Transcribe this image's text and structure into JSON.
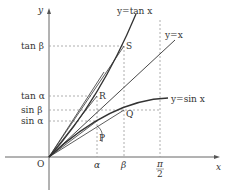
{
  "diagram": {
    "axes": {
      "x_label": "x",
      "y_label": "y",
      "origin_label": "O"
    },
    "curves": [
      {
        "id": "tan",
        "label": "y=tan x"
      },
      {
        "id": "identity",
        "label": "y=x"
      },
      {
        "id": "sin",
        "label": "y=sin x"
      }
    ],
    "x_ticks": [
      {
        "id": "alpha",
        "label": "α"
      },
      {
        "id": "beta",
        "label": "β"
      },
      {
        "id": "pi_half_num",
        "label": "π"
      },
      {
        "id": "pi_half_den",
        "label": "2"
      }
    ],
    "y_ticks": [
      {
        "id": "tan_beta",
        "label": "tan β"
      },
      {
        "id": "tan_alpha",
        "label": "tan α"
      },
      {
        "id": "sin_beta",
        "label": "sin β"
      },
      {
        "id": "sin_alpha",
        "label": "sin α"
      }
    ],
    "points": {
      "S": "S",
      "R": "R",
      "Q": "Q",
      "P": "P"
    },
    "colors": {
      "line": "#333333",
      "dashed": "#999999",
      "axis": "#666666"
    }
  }
}
